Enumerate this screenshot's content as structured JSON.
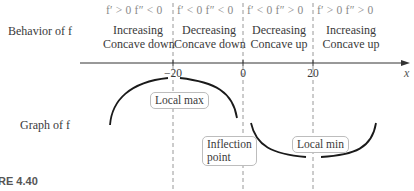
{
  "row_labels": {
    "behavior": "Behavior of f",
    "graph": "Graph of f"
  },
  "intervals": [
    {
      "condition": "f′ > 0  f″ < 0",
      "line1": "Increasing",
      "line2": "Concave down"
    },
    {
      "condition": "f′ < 0  f″ < 0",
      "line1": "Decreasing",
      "line2": "Concave down"
    },
    {
      "condition": "f′ < 0  f″ > 0",
      "line1": "Decreasing",
      "line2": "Concave up"
    },
    {
      "condition": "f′ > 0  f″ > 0",
      "line1": "Increasing",
      "line2": "Concave up"
    }
  ],
  "axis": {
    "label": "x",
    "ticks": [
      "−20",
      "0",
      "20"
    ]
  },
  "callouts": {
    "local_max": "Local max",
    "inflection_line1": "Inflection",
    "inflection_line2": "point",
    "local_min": "Local min"
  },
  "figure_caption": "RE 4.40",
  "colors": {
    "curve": "#1a1a1a",
    "dashed": "#8c8c8c",
    "axis": "#333333"
  }
}
